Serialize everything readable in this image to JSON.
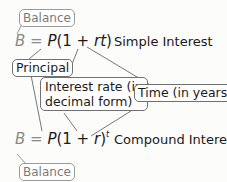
{
  "simple": {
    "balance_label": "Balance",
    "formula": {
      "B": "B",
      "eq": " = ",
      "P": "P",
      "open": "(1 + ",
      "r": "r",
      "t": "t",
      "close": ")"
    },
    "caption": "Simple Interest"
  },
  "shared_labels": {
    "principal": "Principal",
    "interest_rate_line1": "Interest rate (in",
    "interest_rate_line2": "decimal form)",
    "time": "Time (in years)"
  },
  "compound": {
    "formula": {
      "B": "B",
      "eq": " = ",
      "P": "P",
      "open": "(1 + ",
      "r": "r",
      "close": ")",
      "exp": "t"
    },
    "caption": "Compound Interest",
    "balance_label": "Balance"
  },
  "colors": {
    "text": "#1a1a1a",
    "muted": "#8a8a8a",
    "box_border": "#707070",
    "leader_line": "#555555"
  }
}
